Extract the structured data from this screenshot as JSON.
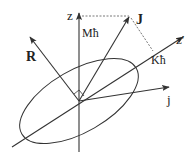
{
  "diagram": {
    "labels": {
      "z": "z",
      "M": "Mħ",
      "J": "J",
      "z_prime": "z′",
      "K": "Kħ",
      "R": "R",
      "j": "j"
    },
    "colors": {
      "stroke": "#333333",
      "text": "#222222"
    }
  }
}
